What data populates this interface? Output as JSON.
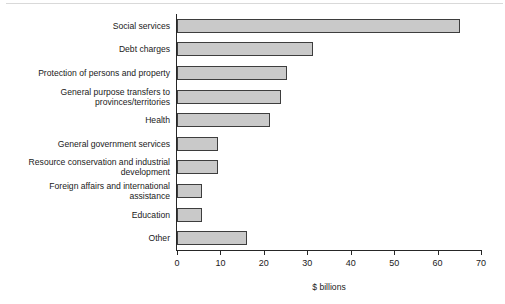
{
  "chart_data": {
    "type": "bar",
    "orientation": "horizontal",
    "title": "",
    "xlabel": "$ billions",
    "ylabel": "",
    "xlim": [
      0,
      70
    ],
    "xticks": [
      0,
      10,
      20,
      30,
      40,
      50,
      60,
      70
    ],
    "xtick_labels": [
      "0",
      "10",
      "20",
      "30",
      "40",
      "50",
      "60",
      "70"
    ],
    "grid": false,
    "legend": null,
    "bar_fill_color": "#c9c9c9",
    "bar_edge_color": "#3d3d3d",
    "axis_color": "#262626",
    "categories": [
      "Social services",
      "Debt charges",
      "Protection of persons and property",
      "General purpose transfers to\nprovinces/territories",
      "Health",
      "General government services",
      "Resource conservation and industrial\ndevelopment",
      "Foreign affairs and international\nassistance",
      "Education",
      "Other"
    ],
    "values": [
      65.2,
      31.3,
      25.3,
      24.0,
      21.4,
      9.4,
      9.4,
      5.8,
      5.8,
      16.1
    ]
  }
}
